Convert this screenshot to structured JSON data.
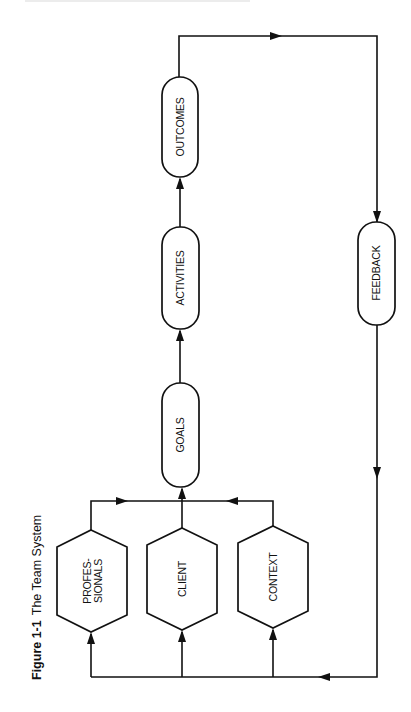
{
  "figure": {
    "number": "Figure 1-1",
    "title": "The Team System"
  },
  "nodes": {
    "professionals": {
      "line1": "PROFES-",
      "line2": "SIONALS",
      "shape": "hexagon"
    },
    "client": {
      "label": "CLIENT",
      "shape": "hexagon"
    },
    "context": {
      "label": "CONTEXT",
      "shape": "hexagon"
    },
    "goals": {
      "label": "GOALS",
      "shape": "capsule"
    },
    "activities": {
      "label": "ACTIVITIES",
      "shape": "capsule"
    },
    "outcomes": {
      "label": "OUTCOMES",
      "shape": "capsule"
    },
    "feedback": {
      "label": "FEEDBACK",
      "shape": "capsule"
    }
  },
  "edges": [
    {
      "from": "professionals",
      "to": "goals"
    },
    {
      "from": "client",
      "to": "goals"
    },
    {
      "from": "context",
      "to": "goals"
    },
    {
      "from": "goals",
      "to": "activities"
    },
    {
      "from": "activities",
      "to": "outcomes"
    },
    {
      "from": "outcomes",
      "to": "feedback"
    },
    {
      "from": "feedback",
      "to": "professionals"
    },
    {
      "from": "feedback",
      "to": "client"
    },
    {
      "from": "feedback",
      "to": "context"
    }
  ],
  "colors": {
    "ink": "#111111",
    "background": "#ffffff"
  }
}
